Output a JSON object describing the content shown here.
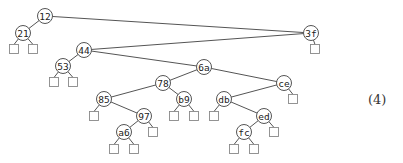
{
  "diagram": {
    "type": "binary-tree",
    "equation_label": "(4)",
    "nodes": [
      {
        "id": "n12",
        "key": "12",
        "x": 45,
        "y": 16
      },
      {
        "id": "n21",
        "key": "21",
        "x": 23,
        "y": 33
      },
      {
        "id": "n3f",
        "key": "3f",
        "x": 311,
        "y": 33
      },
      {
        "id": "n44",
        "key": "44",
        "x": 84,
        "y": 50
      },
      {
        "id": "n53",
        "key": "53",
        "x": 63,
        "y": 66
      },
      {
        "id": "n6a",
        "key": "6a",
        "x": 204,
        "y": 67
      },
      {
        "id": "n78",
        "key": "78",
        "x": 163,
        "y": 83
      },
      {
        "id": "nce",
        "key": "ce",
        "x": 284,
        "y": 83
      },
      {
        "id": "n85",
        "key": "85",
        "x": 104,
        "y": 99
      },
      {
        "id": "nb9",
        "key": "b9",
        "x": 184,
        "y": 99
      },
      {
        "id": "ndb",
        "key": "db",
        "x": 224,
        "y": 99
      },
      {
        "id": "n97",
        "key": "97",
        "x": 144,
        "y": 116
      },
      {
        "id": "ned",
        "key": "ed",
        "x": 264,
        "y": 116
      },
      {
        "id": "na6",
        "key": "a6",
        "x": 124,
        "y": 132
      },
      {
        "id": "nfc",
        "key": "fc",
        "x": 244,
        "y": 132
      }
    ],
    "edges": [
      [
        "n12",
        "n21"
      ],
      [
        "n12",
        "n3f"
      ],
      [
        "n3f",
        "n44"
      ],
      [
        "n44",
        "n53"
      ],
      [
        "n44",
        "n6a"
      ],
      [
        "n6a",
        "n78"
      ],
      [
        "n6a",
        "nce"
      ],
      [
        "n78",
        "n85"
      ],
      [
        "n78",
        "nb9"
      ],
      [
        "nce",
        "ndb"
      ],
      [
        "n85",
        "n97"
      ],
      [
        "ndb",
        "ned"
      ],
      [
        "n97",
        "na6"
      ],
      [
        "ned",
        "nfc"
      ]
    ],
    "leaves": [
      {
        "parent": "n21",
        "x": 14,
        "y": 49
      },
      {
        "parent": "n21",
        "x": 33,
        "y": 49
      },
      {
        "parent": "n3f",
        "x": 315,
        "y": 49
      },
      {
        "parent": "n53",
        "x": 54,
        "y": 82
      },
      {
        "parent": "n53",
        "x": 73,
        "y": 82
      },
      {
        "parent": "nce",
        "x": 293,
        "y": 99
      },
      {
        "parent": "n85",
        "x": 94,
        "y": 116
      },
      {
        "parent": "nb9",
        "x": 174,
        "y": 116
      },
      {
        "parent": "nb9",
        "x": 194,
        "y": 116
      },
      {
        "parent": "ndb",
        "x": 214,
        "y": 116
      },
      {
        "parent": "n97",
        "x": 153,
        "y": 132
      },
      {
        "parent": "ned",
        "x": 274,
        "y": 132
      },
      {
        "parent": "na6",
        "x": 114,
        "y": 149
      },
      {
        "parent": "na6",
        "x": 134,
        "y": 149
      },
      {
        "parent": "nfc",
        "x": 234,
        "y": 149
      },
      {
        "parent": "nfc",
        "x": 254,
        "y": 149
      }
    ]
  }
}
